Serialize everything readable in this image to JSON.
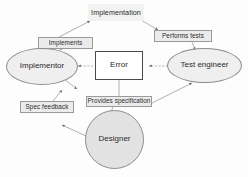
{
  "diagram": {
    "background_color": "#fdfdfd",
    "nodes": [
      {
        "id": "implementation",
        "label": "Implementation",
        "shape": "rectangle",
        "fill": "#f2f2f2",
        "stroke": "none"
      },
      {
        "id": "implements",
        "label": "Implements",
        "shape": "rectangle",
        "fill": "#ebebeb",
        "stroke": "#9a9a9a"
      },
      {
        "id": "performs-tests",
        "label": "Performs tests",
        "shape": "rectangle",
        "fill": "#ebebeb",
        "stroke": "#9a9a9a"
      },
      {
        "id": "implementor",
        "label": "Implementor",
        "shape": "ellipse",
        "fill": "#efefef",
        "stroke": "#8c8c8c"
      },
      {
        "id": "error",
        "label": "Error",
        "shape": "rectangle",
        "fill": "#ffffff",
        "stroke": "#4a4a4a"
      },
      {
        "id": "test-engineer",
        "label": "Test engineer",
        "shape": "ellipse",
        "fill": "#efefef",
        "stroke": "#8c8c8c"
      },
      {
        "id": "provides-specification",
        "label": "Provides specification",
        "shape": "rectangle",
        "fill": "#ebebeb",
        "stroke": "#9a9a9a"
      },
      {
        "id": "spec-feedback",
        "label": "Spec feedback",
        "shape": "rectangle",
        "fill": "#ebebeb",
        "stroke": "#9a9a9a"
      },
      {
        "id": "designer",
        "label": "Designer",
        "shape": "circle",
        "fill": "#e2e2e2",
        "stroke": "#8c8c8c"
      }
    ],
    "edges": [
      {
        "from": "implementor",
        "to": "implements",
        "style": "solid",
        "arrow": "end"
      },
      {
        "from": "implements",
        "to": "implementation",
        "style": "solid",
        "arrow": "end"
      },
      {
        "from": "implementation",
        "to": "performs-tests",
        "style": "solid",
        "arrow": "end"
      },
      {
        "from": "performs-tests",
        "to": "test-engineer",
        "style": "solid",
        "arrow": "end"
      },
      {
        "from": "error",
        "to": "implementor",
        "style": "dashed",
        "arrow": "end"
      },
      {
        "from": "test-engineer",
        "to": "error",
        "style": "dashed",
        "arrow": "end"
      },
      {
        "from": "error",
        "to": "provides-specification",
        "style": "solid",
        "arrow": "none"
      },
      {
        "from": "provides-specification",
        "to": "designer",
        "style": "solid",
        "arrow": "end"
      },
      {
        "from": "provides-specification",
        "to": "test-engineer",
        "style": "solid",
        "arrow": "end"
      },
      {
        "from": "implementor",
        "to": "provides-specification",
        "style": "solid",
        "arrow": "end"
      },
      {
        "from": "spec-feedback",
        "to": "implementor",
        "style": "solid",
        "arrow": "end"
      },
      {
        "from": "designer",
        "to": "spec-feedback",
        "style": "solid",
        "arrow": "end"
      }
    ]
  }
}
